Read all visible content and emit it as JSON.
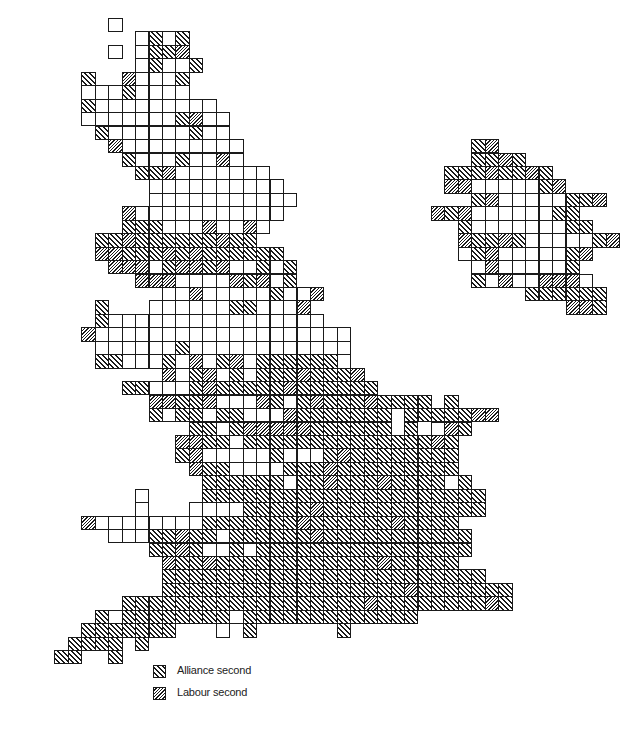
{
  "map": {
    "type": "cartogram",
    "description": "Square-cell constituency cartogram of Great Britain showing second-placed party",
    "grid": {
      "origin_x": 27.5,
      "origin_y": 18,
      "cell_size": 13.45,
      "key": {
        ".": "none",
        "o": "other second",
        "a": "Alliance second",
        "l": "Labour second"
      },
      "rows": [
        "......o...........................",
        "........oaoa......................",
        "......o.oaal......................",
        "........oaooa.....................",
        "....a..loooa......................",
        "....oooaoooo......................",
        "....aooooooooo......................",
        "....oooooooaloo.....................",
        ".....aooooooaoo.......................",
        "......looooooooo.................al..",
        ".......aoooaoolo.................aala",
        "........aalooooooo.............aaalaala..",
        ".........oooooooooo............lloooooal.",
        ".........ooooooooooo.............alo.oooaal",
        ".......looooooooooo...........lal.oooooaa",
        ".......aaaooolo.lo..............aoooooooaa",
        ".....aalaaaaaalaa...............laalaoooooal",
        ".....llaaalalaaaaaa.............oaloooooal",
        "......llloallalooaoa.............oloooooa",
        "........llloooolaloa.............aoloolllo",
        "..........ooloooooaool...............aaaaaa",
        ".....a...ooooooaaoool...................lla",
        ".....aoooooooooooooooo.........",
        "....looooooooooooooooooo",
        ".....ooooooaoooooooooooo",
        ".....aaoooaoloaloaaaaaao",
        "..........loaloaoaaalaaal",
        ".......aaoooalaaaaalaaaaaa",
        ".........llaalooolaoalaaalaaaa.a",
        ".........aoaaoaaooolaaaaaaa.aaaaall",
        "............aaoalllllaaaaaa.a.ola",
        "...........llaaoaaaaaaaaaaaaaala",
        "...........aloooooaoooalaaaaaaaa",
        "............laaooooaaalaaaaaaaaa",
        ".............aaaaaaoaalaaalaaaa.a",
        "........o....aaaaaaaaaaaaaaaaaaaaa",
        "........o...ooooaaaaalaaaaaaaaaaaa",
        "....looooooooaaaaaaalaaaaaalaaaa",
        "......oooaalaaoaaaaaalaaaaaaaaaaa",
        ".........aalaooaoaaaaaaaaaaaaaaaa",
        "..........laalaaaaaaaaaaaalaaaaa",
        "..........aaaaaaaaaaaaaaaaaaaaaaaa",
        "..........aaaaaaaaaaaaaaaaaalaaaaaaa",
        ".......aaaaaaaaaaaaaaaaaalaaaaaaaala",
        ".....aoaaaaaaaaoaaaaaaaaaaaaa",
        "....aaaaaaa...o.a......a",
        "...aaaa.a...........",
        "..aa..a....."
      ]
    },
    "legend": [
      {
        "label": "Alliance second",
        "pattern": "alliance-hatch"
      },
      {
        "label": "Labour second",
        "pattern": "labour-hatch"
      }
    ],
    "colors": {
      "line": "#1a1a1a",
      "background": "#ffffff"
    }
  }
}
